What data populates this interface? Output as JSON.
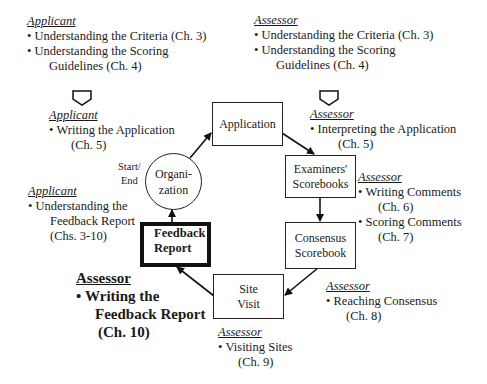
{
  "diagram": {
    "nodes": {
      "application": "Application",
      "examiners_line1": "Examiners'",
      "examiners_line2": "Scorebooks",
      "consensus_line1": "Consensus",
      "consensus_line2": "Scorebook",
      "site_visit_line1": "Site",
      "site_visit_line2": "Visit",
      "feedback_line1": "Feedback",
      "feedback_line2": "Report",
      "organization_line1": "Organi-",
      "organization_line2": "zation",
      "start_end_line1": "Start/",
      "start_end_line2": "End"
    },
    "edges": [
      {
        "from": "Organization",
        "to": "Application"
      },
      {
        "from": "Application",
        "to": "Examiners' Scorebooks"
      },
      {
        "from": "Examiners' Scorebooks",
        "to": "Consensus Scorebook"
      },
      {
        "from": "Consensus Scorebook",
        "to": "Site Visit"
      },
      {
        "from": "Site Visit",
        "to": "Feedback Report"
      },
      {
        "from": "Feedback Report",
        "to": "Organization"
      }
    ],
    "annotations": {
      "applicant_top": {
        "role": "Applicant",
        "item1": "Understanding the Criteria (Ch. 3)",
        "item2_line1": "Understanding the Scoring",
        "item2_line2": "Guidelines (Ch. 4)"
      },
      "applicant_writing": {
        "role": "Applicant",
        "item1_line1": "Writing the Application",
        "item1_line2": "(Ch. 5)"
      },
      "applicant_feedback": {
        "role": "Applicant",
        "item1_line1": "Understanding the",
        "item1_line2": "Feedback Report",
        "item1_line3": "(Chs. 3-10)"
      },
      "assessor_feedback": {
        "role": "Assessor",
        "item1_line1": "Writing the",
        "item1_line2": "Feedback Report",
        "item1_line3": "(Ch. 10)"
      },
      "assessor_top": {
        "role": "Assessor",
        "item1": "Understanding the Criteria (Ch. 3)",
        "item2_line1": "Understanding the Scoring",
        "item2_line2": "Guidelines (Ch. 4)"
      },
      "assessor_interpreting": {
        "role": "Assessor",
        "item1_line1": "Interpreting the Application",
        "item1_line2": "(Ch. 5)"
      },
      "assessor_scoring": {
        "role": "Assessor",
        "item1_line1": "Writing Comments",
        "item1_line2": "(Ch. 6)",
        "item2_line1": "Scoring Comments",
        "item2_line2": "(Ch. 7)"
      },
      "assessor_consensus": {
        "role": "Assessor",
        "item1_line1": "Reaching Consensus",
        "item1_line2": "(Ch. 8)"
      },
      "assessor_site": {
        "role": "Assessor",
        "item1_line1": "Visiting Sites",
        "item1_line2": "(Ch. 9)"
      }
    }
  }
}
